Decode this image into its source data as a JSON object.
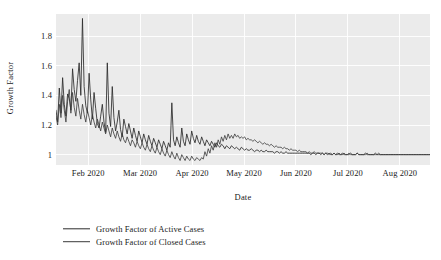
{
  "chart_data": {
    "type": "line",
    "title": "",
    "xlabel": "Date",
    "ylabel": "Growth Factor",
    "ylim": [
      0.93,
      1.95
    ],
    "yticks": [
      1,
      1.2,
      1.4,
      1.6,
      1.8
    ],
    "ytick_labels": [
      "1",
      "1.2",
      "1.4",
      "1.6",
      "1.8"
    ],
    "xlim": [
      "2020-01-22",
      "2020-09-05"
    ],
    "xticks": [
      "2020-02-01",
      "2020-03-01",
      "2020-04-01",
      "2020-05-01",
      "2020-06-01",
      "2020-07-01",
      "2020-08-01"
    ],
    "xtick_labels": [
      "Feb 2020",
      "Mar 2020",
      "Apr 2020",
      "May 2020",
      "Jun 2020",
      "Jul 2020",
      "Aug 2020"
    ],
    "grid": true,
    "grid_color": "#ffffff",
    "panel_background": "#ebebeb",
    "legend_position": "bottom-left",
    "series": [
      {
        "name": "Growth Factor of Active Cases",
        "color": "#2b2b2b",
        "values": [
          1.3,
          1.22,
          1.45,
          1.28,
          1.52,
          1.34,
          1.26,
          1.41,
          1.38,
          1.3,
          1.58,
          1.44,
          1.36,
          1.5,
          1.62,
          1.4,
          1.92,
          1.46,
          1.33,
          1.28,
          1.55,
          1.37,
          1.24,
          1.42,
          1.31,
          1.21,
          1.18,
          1.26,
          1.34,
          1.22,
          1.15,
          1.62,
          1.28,
          1.19,
          1.46,
          1.25,
          1.16,
          1.22,
          1.3,
          1.17,
          1.12,
          1.24,
          1.19,
          1.14,
          1.21,
          1.16,
          1.11,
          1.18,
          1.13,
          1.09,
          1.16,
          1.12,
          1.08,
          1.14,
          1.1,
          1.07,
          1.13,
          1.09,
          1.06,
          1.11,
          1.08,
          1.05,
          1.1,
          1.07,
          1.04,
          1.09,
          1.06,
          1.03,
          1.08,
          1.05,
          1.35,
          1.1,
          1.06,
          1.12,
          1.08,
          1.05,
          1.18,
          1.09,
          1.06,
          1.14,
          1.1,
          1.07,
          1.16,
          1.11,
          1.08,
          1.13,
          1.09,
          1.07,
          1.12,
          1.09,
          1.06,
          1.1,
          1.08,
          1.06,
          1.09,
          1.07,
          1.05,
          1.08,
          1.06,
          1.05,
          1.07,
          1.06,
          1.04,
          1.06,
          1.05,
          1.04,
          1.06,
          1.05,
          1.04,
          1.05,
          1.04,
          1.03,
          1.05,
          1.04,
          1.03,
          1.04,
          1.03,
          1.03,
          1.04,
          1.03,
          1.02,
          1.03,
          1.03,
          1.02,
          1.03,
          1.02,
          1.02,
          1.03,
          1.02,
          1.02,
          1.02,
          1.02,
          1.01,
          1.02,
          1.02,
          1.01,
          1.02,
          1.01,
          1.01,
          1.02,
          1.01,
          1.01,
          1.01,
          1.01,
          1.01,
          1.01,
          1.01,
          1.01,
          1.01,
          1.01,
          1.01,
          1.01,
          1.01,
          1.01,
          1.0,
          1.01,
          1.01,
          1.0,
          1.01,
          1.01,
          1.0,
          1.01,
          1.0,
          1.01,
          1.0,
          1.01,
          1.0,
          1.0,
          1.01,
          1.0,
          1.0,
          1.01,
          1.0,
          1.0,
          1.01,
          1.0,
          1.0,
          1.0,
          1.01,
          1.0,
          1.0,
          1.0,
          1.01,
          1.0,
          1.0,
          1.0,
          1.0,
          1.01,
          1.0,
          1.0,
          1.0,
          1.0,
          1.0,
          1.01,
          1.0,
          1.0,
          1.0,
          1.0,
          1.0,
          1.0,
          1.0,
          1.0,
          1.0,
          1.0,
          1.0,
          1.0,
          1.0,
          1.0,
          1.0,
          1.0,
          1.0,
          1.0,
          1.0,
          1.0,
          1.0,
          1.0,
          1.0,
          1.0,
          1.0,
          1.0,
          1.0,
          1.0,
          1.0,
          1.0,
          1.0,
          1.0,
          1.0
        ]
      },
      {
        "name": "Growth Factor of Closed Cases",
        "color": "#3a3a3a",
        "values": [
          1.26,
          1.2,
          1.34,
          1.25,
          1.4,
          1.3,
          1.22,
          1.36,
          1.44,
          1.28,
          1.42,
          1.32,
          1.26,
          1.38,
          1.3,
          1.24,
          1.34,
          1.27,
          1.22,
          1.3,
          1.25,
          1.2,
          1.27,
          1.22,
          1.18,
          1.24,
          1.2,
          1.16,
          1.22,
          1.18,
          1.14,
          1.2,
          1.16,
          1.12,
          1.18,
          1.14,
          1.11,
          1.16,
          1.12,
          1.09,
          1.14,
          1.1,
          1.08,
          1.12,
          1.09,
          1.06,
          1.1,
          1.08,
          1.05,
          1.09,
          1.06,
          1.04,
          1.08,
          1.05,
          1.03,
          1.07,
          1.04,
          1.02,
          1.06,
          1.03,
          1.01,
          1.05,
          1.02,
          1.0,
          1.04,
          1.01,
          0.99,
          1.03,
          1.0,
          0.98,
          1.02,
          0.99,
          0.97,
          1.01,
          0.98,
          0.96,
          1.0,
          0.98,
          0.96,
          0.99,
          0.97,
          0.96,
          0.99,
          0.97,
          0.96,
          0.98,
          0.97,
          0.96,
          0.98,
          0.97,
          1.02,
          0.99,
          1.04,
          1.01,
          1.06,
          1.03,
          1.08,
          1.05,
          1.1,
          1.07,
          1.12,
          1.09,
          1.13,
          1.1,
          1.14,
          1.11,
          1.13,
          1.11,
          1.14,
          1.12,
          1.13,
          1.11,
          1.12,
          1.11,
          1.12,
          1.1,
          1.11,
          1.1,
          1.1,
          1.09,
          1.1,
          1.09,
          1.08,
          1.09,
          1.08,
          1.07,
          1.08,
          1.07,
          1.07,
          1.06,
          1.07,
          1.06,
          1.05,
          1.06,
          1.05,
          1.05,
          1.05,
          1.04,
          1.05,
          1.04,
          1.04,
          1.03,
          1.04,
          1.03,
          1.03,
          1.03,
          1.02,
          1.03,
          1.02,
          1.02,
          1.02,
          1.02,
          1.01,
          1.02,
          1.01,
          1.01,
          1.02,
          1.01,
          1.01,
          1.01,
          1.01,
          1.01,
          1.0,
          1.01,
          1.01,
          1.0,
          1.01,
          1.0,
          1.01,
          1.0,
          1.01,
          1.0,
          1.0,
          1.01,
          1.0,
          1.0,
          1.0,
          1.01,
          1.0,
          1.0,
          1.0,
          1.0,
          1.01,
          1.0,
          1.0,
          1.0,
          1.0,
          1.0,
          1.01,
          1.0,
          1.0,
          1.0,
          1.0,
          1.0,
          1.0,
          1.01,
          1.0,
          1.0,
          1.0,
          1.0,
          1.0,
          1.0,
          1.0,
          1.0,
          1.0,
          1.0,
          1.0,
          1.0,
          1.0,
          1.0,
          1.0,
          1.0,
          1.0,
          1.0,
          1.0,
          1.0,
          1.0,
          1.0,
          1.0,
          1.0,
          1.0,
          1.0,
          1.0,
          1.0,
          1.0,
          1.0,
          1.0
        ]
      }
    ]
  },
  "axes": {
    "ylabel": "Growth Factor",
    "xlabel": "Date"
  },
  "legend": {
    "items": [
      {
        "label": "Growth Factor of Active Cases"
      },
      {
        "label": "Growth Factor of Closed Cases"
      }
    ]
  }
}
